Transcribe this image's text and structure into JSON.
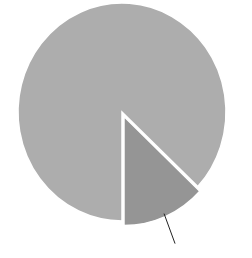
{
  "chart_data": {
    "type": "pie",
    "title": "",
    "categories": [
      "Slice A",
      "Slice B"
    ],
    "values": [
      87,
      13
    ],
    "colors": [
      "#adadad",
      "#959595"
    ],
    "exploded": [
      false,
      true
    ],
    "start_angle_deg": 90,
    "labels_visible": false,
    "leader_line": {
      "slice": 1,
      "color": "#222222"
    },
    "legend": "none"
  }
}
